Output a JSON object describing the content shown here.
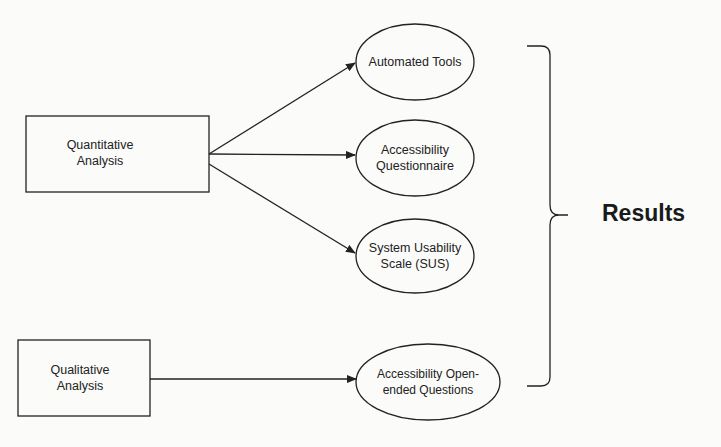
{
  "diagram": {
    "sources": [
      {
        "id": "quantitative",
        "label_line1": "Quantitative",
        "label_line2": "Analysis"
      },
      {
        "id": "qualitative",
        "label_line1": "Qualitative",
        "label_line2": "Analysis"
      }
    ],
    "methods": [
      {
        "id": "automated-tools",
        "label_line1": "Automated Tools",
        "label_line2": ""
      },
      {
        "id": "accessibility-questionnaire",
        "label_line1": "Accessibility",
        "label_line2": "Questionnaire"
      },
      {
        "id": "sus",
        "label_line1": "System Usability",
        "label_line2": "Scale (SUS)"
      },
      {
        "id": "open-ended",
        "label_line1": "Accessibility Open-",
        "label_line2": "ended Questions"
      }
    ],
    "edges": [
      {
        "from": "quantitative",
        "to": "automated-tools"
      },
      {
        "from": "quantitative",
        "to": "accessibility-questionnaire"
      },
      {
        "from": "quantitative",
        "to": "sus"
      },
      {
        "from": "qualitative",
        "to": "open-ended"
      }
    ],
    "outcome": {
      "label": "Results"
    },
    "colors": {
      "stroke": "#222222",
      "background": "#fbfbfa",
      "text": "#222222"
    }
  }
}
